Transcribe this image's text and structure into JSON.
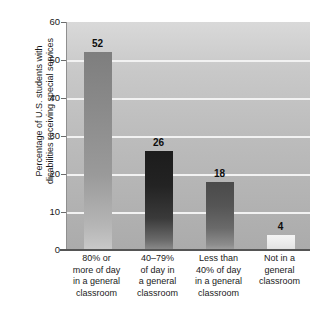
{
  "chart_data": {
    "type": "bar",
    "title": "",
    "xlabel": "",
    "ylabel": "Percentage of U.S. students with disabilities receiving special services",
    "ylabel_lines": [
      "Percentage of U.S. students with",
      "disabilities receiving special services"
    ],
    "categories": [
      "80% or more of day in a general classroom",
      "40–79% of day in a general classroom",
      "Less than 40% of day in a general classroom",
      "Not in a general classroom"
    ],
    "category_lines": [
      [
        "80% or",
        "more of day",
        "in a general",
        "classroom"
      ],
      [
        "40–79%",
        "of day in",
        "a general",
        "classroom"
      ],
      [
        "Less than",
        "40% of day",
        "in a general",
        "classroom"
      ],
      [
        "Not in a",
        "general",
        "classroom"
      ]
    ],
    "values": [
      52,
      26,
      18,
      4
    ],
    "value_labels": [
      "52",
      "26",
      "18",
      "4"
    ],
    "ylim": [
      0,
      60
    ],
    "yticks": [
      0,
      10,
      20,
      30,
      40,
      50,
      60
    ],
    "ytick_labels": [
      "0",
      "10",
      "20",
      "30",
      "40",
      "50",
      "60"
    ],
    "grid": true,
    "gridline_color": "#f2f2f2",
    "legend": null,
    "plot_background": "#c0c0c0",
    "bar_colors": [
      "#8a8a8a",
      "#2a2a2a",
      "#5a5a5a",
      "#eeeeee"
    ]
  }
}
